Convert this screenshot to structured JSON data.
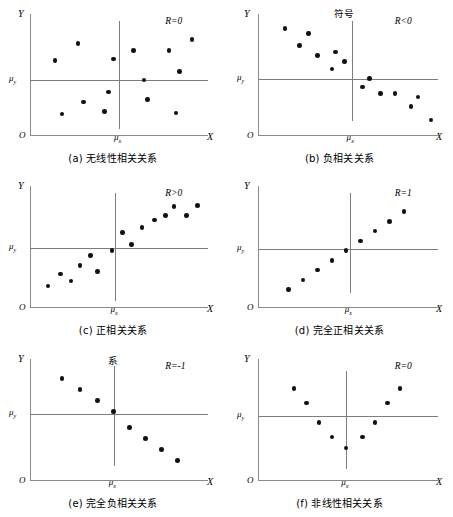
{
  "figure": {
    "axis_labels": {
      "x": "X",
      "y": "Y",
      "origin": "O",
      "mu_x": "μ",
      "mu_y": "μ",
      "mu_x_sub": "x",
      "mu_y_sub": "y"
    },
    "colors": {
      "axis": "#8a8a8a",
      "mean_line": "#7d7d7d",
      "dot": "#111111",
      "background": "#ffffff"
    }
  },
  "chart_data": [
    {
      "type": "scatter",
      "panel": "a",
      "caption": "(a) 无线性相关关系",
      "annotation": "R=0",
      "xlabel": "X",
      "ylabel": "Y",
      "xlim": [
        0,
        100
      ],
      "ylim": [
        0,
        100
      ],
      "mean_x": 50,
      "mean_y": 46,
      "grid": false,
      "points": [
        [
          18,
          18
        ],
        [
          14,
          62
        ],
        [
          27,
          76
        ],
        [
          30,
          28
        ],
        [
          44,
          36
        ],
        [
          47,
          63
        ],
        [
          42,
          20
        ],
        [
          58,
          70
        ],
        [
          64,
          46
        ],
        [
          66,
          30
        ],
        [
          78,
          70
        ],
        [
          84,
          53
        ],
        [
          82,
          19
        ],
        [
          91,
          79
        ]
      ]
    },
    {
      "type": "scatter",
      "panel": "b",
      "caption": "(b) 负相关关系",
      "annotation": "R<0",
      "stray_label": "符号",
      "xlabel": "X",
      "ylabel": "Y",
      "xlim": [
        0,
        100
      ],
      "ylim": [
        0,
        100
      ],
      "mean_x": 52,
      "mean_y": 47,
      "grid": false,
      "points": [
        [
          15,
          88
        ],
        [
          23,
          74
        ],
        [
          28,
          84
        ],
        [
          33,
          66
        ],
        [
          43,
          69
        ],
        [
          41,
          55
        ],
        [
          48,
          61
        ],
        [
          58,
          40
        ],
        [
          62,
          47
        ],
        [
          68,
          35
        ],
        [
          76,
          35
        ],
        [
          85,
          24
        ],
        [
          89,
          32
        ],
        [
          96,
          13
        ]
      ]
    },
    {
      "type": "scatter",
      "panel": "c",
      "caption": "(c) 正相关关系",
      "annotation": "R>0",
      "xlabel": "X",
      "ylabel": "Y",
      "xlim": [
        0,
        100
      ],
      "ylim": [
        0,
        100
      ],
      "mean_x": 48,
      "mean_y": 49,
      "grid": false,
      "points": [
        [
          10,
          18
        ],
        [
          17,
          28
        ],
        [
          23,
          22
        ],
        [
          28,
          35
        ],
        [
          34,
          43
        ],
        [
          38,
          30
        ],
        [
          46,
          47
        ],
        [
          52,
          62
        ],
        [
          57,
          52
        ],
        [
          63,
          66
        ],
        [
          70,
          72
        ],
        [
          76,
          76
        ],
        [
          81,
          83
        ],
        [
          88,
          76
        ],
        [
          94,
          84
        ]
      ]
    },
    {
      "type": "scatter",
      "panel": "d",
      "caption": "(d) 完全正相关关系",
      "annotation": "R=1",
      "xlabel": "X",
      "ylabel": "Y",
      "xlim": [
        0,
        100
      ],
      "ylim": [
        0,
        100
      ],
      "mean_x": 51,
      "mean_y": 48,
      "grid": false,
      "points": [
        [
          17,
          15
        ],
        [
          25,
          23
        ],
        [
          33,
          31
        ],
        [
          41,
          39
        ],
        [
          49,
          47
        ],
        [
          57,
          55
        ],
        [
          65,
          63
        ],
        [
          73,
          71
        ],
        [
          81,
          79
        ]
      ]
    },
    {
      "type": "scatter",
      "panel": "e",
      "caption": "(e) 完全负相关关系",
      "annotation": "R=-1",
      "stray_label": "系",
      "xlabel": "X",
      "ylabel": "Y",
      "xlim": [
        0,
        100
      ],
      "ylim": [
        0,
        100
      ],
      "mean_x": 47,
      "mean_y": 55,
      "grid": false,
      "points": [
        [
          18,
          84
        ],
        [
          28,
          75
        ],
        [
          38,
          66
        ],
        [
          47,
          57
        ],
        [
          56,
          44
        ],
        [
          65,
          35
        ],
        [
          74,
          26
        ],
        [
          83,
          17
        ]
      ]
    },
    {
      "type": "scatter",
      "panel": "f",
      "caption": "(f) 非线性相关关系",
      "annotation": "R=0",
      "xlabel": "X",
      "ylabel": "Y",
      "xlim": [
        0,
        100
      ],
      "ylim": [
        0,
        100
      ],
      "mean_x": 49,
      "mean_y": 53,
      "grid": false,
      "points": [
        [
          20,
          76
        ],
        [
          27,
          64
        ],
        [
          34,
          48
        ],
        [
          41,
          36
        ],
        [
          49,
          27
        ],
        [
          58,
          36
        ],
        [
          65,
          48
        ],
        [
          72,
          64
        ],
        [
          79,
          76
        ]
      ]
    }
  ]
}
